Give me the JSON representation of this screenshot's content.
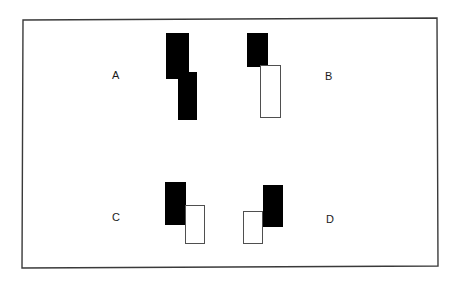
{
  "figure": {
    "background_color": "#ffffff",
    "frame": {
      "name": "outer-border",
      "stroke_color": "#3a3a3a",
      "stroke_width": 1.4,
      "fill": "none",
      "points": "23,20 437,18 438,266 22,268"
    },
    "bar_fill_black": "#000000",
    "bar_fill_white": "#ffffff",
    "bar_stroke_white": "#4f4f4f",
    "groups": [
      {
        "id": "A",
        "label": "A",
        "label_x": 112,
        "label_y": 70,
        "bars": [
          {
            "name": "bar-a-upper",
            "fill": "black",
            "x": 166,
            "y": 33,
            "w": 23,
            "h": 46
          },
          {
            "name": "bar-a-lower",
            "fill": "black",
            "x": 178,
            "y": 72,
            "w": 19,
            "h": 48
          }
        ]
      },
      {
        "id": "B",
        "label": "B",
        "label_x": 325,
        "label_y": 71,
        "bars": [
          {
            "name": "bar-b-upper",
            "fill": "black",
            "x": 247,
            "y": 33,
            "w": 21,
            "h": 34
          },
          {
            "name": "bar-b-lower",
            "fill": "white",
            "x": 260,
            "y": 65,
            "w": 21,
            "h": 53
          }
        ]
      },
      {
        "id": "C",
        "label": "C",
        "label_x": 112,
        "label_y": 212,
        "bars": [
          {
            "name": "bar-c-left",
            "fill": "black",
            "x": 165,
            "y": 182,
            "w": 21,
            "h": 43
          },
          {
            "name": "bar-c-right",
            "fill": "white",
            "x": 185,
            "y": 205,
            "w": 20,
            "h": 39
          }
        ]
      },
      {
        "id": "D",
        "label": "D",
        "label_x": 326,
        "label_y": 214,
        "bars": [
          {
            "name": "bar-d-left",
            "fill": "white",
            "x": 243,
            "y": 211,
            "w": 20,
            "h": 33
          },
          {
            "name": "bar-d-right",
            "fill": "black",
            "x": 263,
            "y": 185,
            "w": 20,
            "h": 42
          }
        ]
      }
    ]
  }
}
